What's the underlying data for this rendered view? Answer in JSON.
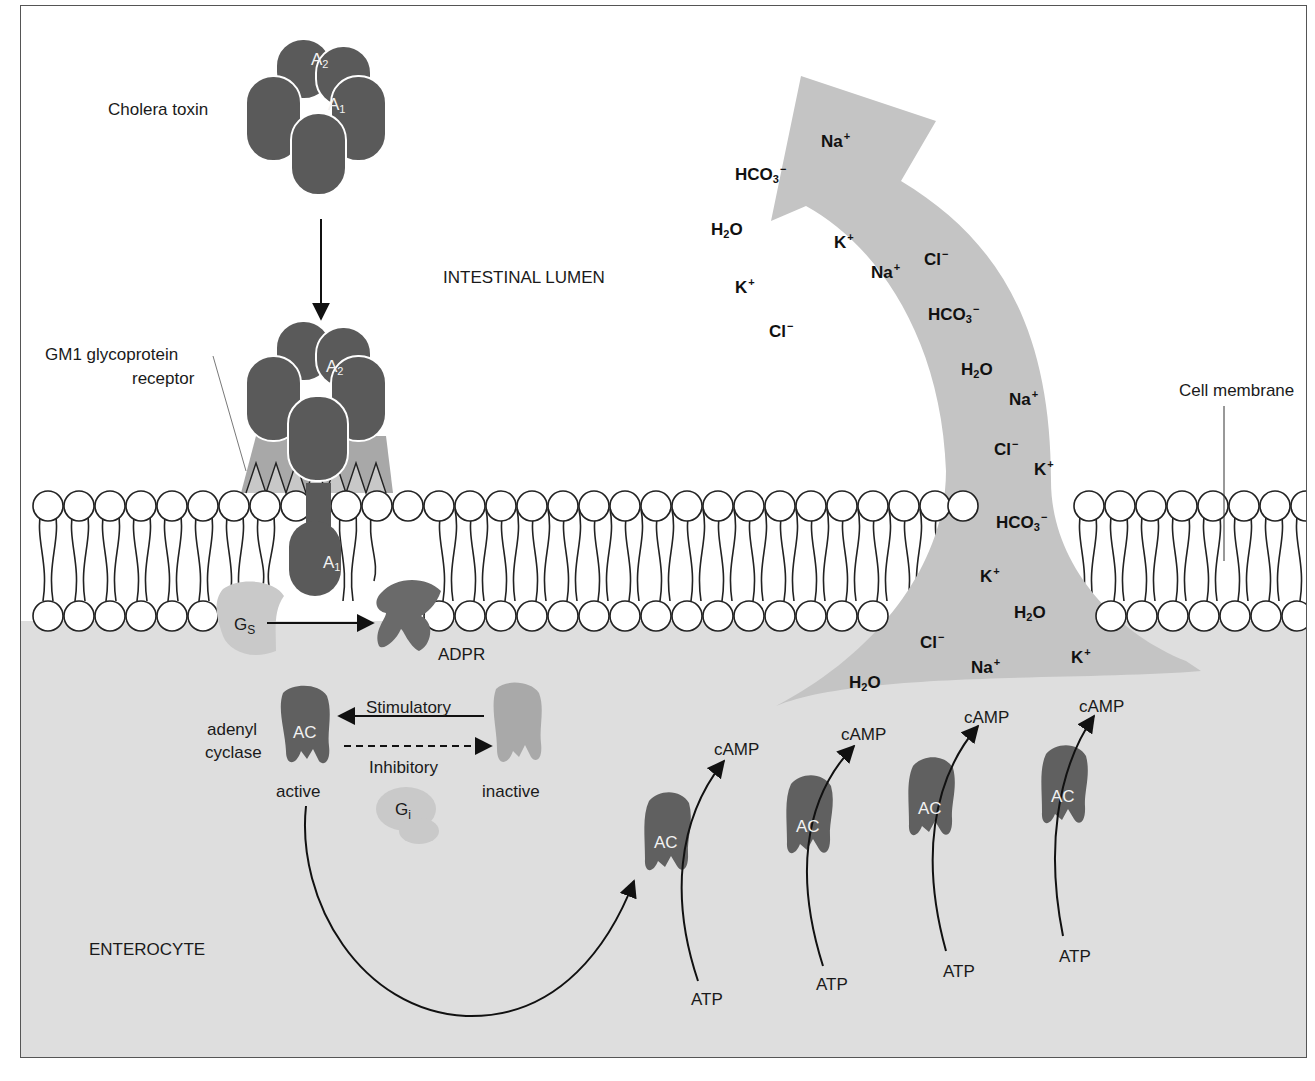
{
  "figure": {
    "colors": {
      "toxin": "#5a5a5a",
      "receptor": "#a8a8a8",
      "cytoplasm": "#dedede",
      "efflux_arrow": "#c4c4c4",
      "gs": "#c9c9c9",
      "ac_active": "#606060",
      "ac_inactive": "#a9a9a9",
      "membrane_line": "#222222"
    }
  },
  "regions": {
    "lumen": "INTESTINAL LUMEN",
    "cell": "ENTEROCYTE"
  },
  "labels": {
    "cholera_toxin": "Cholera toxin",
    "receptor_line1": "GM1 glycoprotein",
    "receptor_line2": "receptor",
    "cell_membrane": "Cell membrane",
    "subunit_a2": "A",
    "subunit_a2_sub": "2",
    "subunit_a1": "A",
    "subunit_a1_sub": "1",
    "gs": "G",
    "gs_sub": "S",
    "gi": "G",
    "gi_sub": "i",
    "adpr": "ADPR",
    "adenyl_line1": "adenyl",
    "adenyl_line2": "cyclase",
    "ac": "AC",
    "stimulatory": "Stimulatory",
    "inhibitory": "Inhibitory",
    "active": "active",
    "inactive": "inactive"
  },
  "camp_production": [
    {
      "enzyme": "AC",
      "substrate": "ATP",
      "product": "cAMP"
    },
    {
      "enzyme": "AC",
      "substrate": "ATP",
      "product": "cAMP"
    },
    {
      "enzyme": "AC",
      "substrate": "ATP",
      "product": "cAMP"
    },
    {
      "enzyme": "AC",
      "substrate": "ATP",
      "product": "cAMP"
    }
  ],
  "ions_lumen": [
    {
      "base": "Na",
      "sub": "",
      "charge": "+"
    },
    {
      "base": "HCO",
      "sub": "3",
      "charge": "−"
    },
    {
      "base": "H",
      "sub": "2",
      "tail": "O",
      "charge": ""
    },
    {
      "base": "K",
      "sub": "",
      "charge": "+"
    },
    {
      "base": "Cl",
      "sub": "",
      "charge": "−"
    }
  ],
  "ions_in_arrow": [
    {
      "base": "K",
      "charge": "+"
    },
    {
      "base": "Na",
      "charge": "+"
    },
    {
      "base": "Cl",
      "charge": "−"
    },
    {
      "base": "HCO",
      "sub": "3",
      "charge": "−"
    },
    {
      "base": "H",
      "sub": "2",
      "tail": "O"
    },
    {
      "base": "Na",
      "charge": "+"
    },
    {
      "base": "Cl",
      "charge": "−"
    },
    {
      "base": "K",
      "charge": "+"
    },
    {
      "base": "HCO",
      "sub": "3",
      "charge": "−"
    },
    {
      "base": "K",
      "charge": "+"
    },
    {
      "base": "H",
      "sub": "2",
      "tail": "O"
    },
    {
      "base": "Cl",
      "charge": "−"
    },
    {
      "base": "Na",
      "charge": "+"
    },
    {
      "base": "K",
      "charge": "+"
    },
    {
      "base": "H",
      "sub": "2",
      "tail": "O"
    }
  ]
}
